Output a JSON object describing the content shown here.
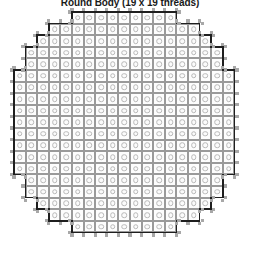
{
  "title": "Round Body (19 x 19 threads)",
  "diagram": {
    "name": "round-body-thread-grid",
    "shape": "octagon",
    "threads_across": 19,
    "threads_down": 19,
    "cell_pitch_px": 11.6,
    "colors": {
      "cell_fill": "#fdfdfd",
      "cell_stroke": "#9a9a9a",
      "disc_stroke": "#b9b9b9",
      "outline": "#1e1e1e",
      "nub": "#a8a8a8",
      "background": "#ffffff",
      "title": "#1a1a1a"
    },
    "row_spans": [
      {
        "row": 1,
        "start": 6,
        "end": 14,
        "count": 9
      },
      {
        "row": 2,
        "start": 4,
        "end": 16,
        "count": 13
      },
      {
        "row": 3,
        "start": 3,
        "end": 17,
        "count": 15
      },
      {
        "row": 4,
        "start": 2,
        "end": 18,
        "count": 17
      },
      {
        "row": 5,
        "start": 2,
        "end": 18,
        "count": 17
      },
      {
        "row": 6,
        "start": 1,
        "end": 19,
        "count": 19
      },
      {
        "row": 7,
        "start": 1,
        "end": 19,
        "count": 19
      },
      {
        "row": 8,
        "start": 1,
        "end": 19,
        "count": 19
      },
      {
        "row": 9,
        "start": 1,
        "end": 19,
        "count": 19
      },
      {
        "row": 10,
        "start": 1,
        "end": 19,
        "count": 19
      },
      {
        "row": 11,
        "start": 1,
        "end": 19,
        "count": 19
      },
      {
        "row": 12,
        "start": 1,
        "end": 19,
        "count": 19
      },
      {
        "row": 13,
        "start": 1,
        "end": 19,
        "count": 19
      },
      {
        "row": 14,
        "start": 1,
        "end": 19,
        "count": 19
      },
      {
        "row": 15,
        "start": 2,
        "end": 18,
        "count": 17
      },
      {
        "row": 16,
        "start": 2,
        "end": 18,
        "count": 17
      },
      {
        "row": 17,
        "start": 3,
        "end": 17,
        "count": 15
      },
      {
        "row": 18,
        "start": 4,
        "end": 16,
        "count": 13
      },
      {
        "row": 19,
        "start": 6,
        "end": 14,
        "count": 9
      }
    ]
  }
}
